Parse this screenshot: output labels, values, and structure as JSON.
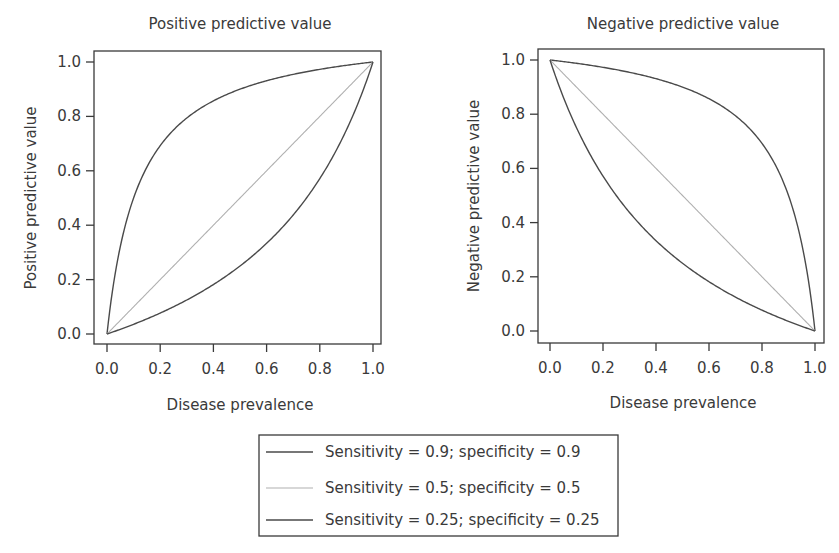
{
  "chart_data": [
    {
      "type": "line",
      "title": "Positive predictive value",
      "xlabel": "Disease prevalence",
      "ylabel": "Positive predictive value",
      "xlim": [
        0,
        1
      ],
      "ylim": [
        0,
        1
      ],
      "xticks": [
        "0.0",
        "0.2",
        "0.4",
        "0.6",
        "0.8",
        "1.0"
      ],
      "yticks": [
        "0.0",
        "0.2",
        "0.4",
        "0.6",
        "0.8",
        "1.0"
      ],
      "grid": false,
      "x": [
        0.0,
        0.05,
        0.1,
        0.2,
        0.3,
        0.4,
        0.5,
        0.6,
        0.7,
        0.8,
        0.9,
        0.95,
        1.0
      ],
      "series": [
        {
          "name": "Sensitivity = 0.9; specificity = 0.9",
          "values": [
            0.0,
            0.321,
            0.5,
            0.692,
            0.794,
            0.857,
            0.9,
            0.931,
            0.955,
            0.973,
            0.988,
            0.994,
            1.0
          ]
        },
        {
          "name": "Sensitivity = 0.5; specificity = 0.5",
          "values": [
            0.0,
            0.05,
            0.1,
            0.2,
            0.3,
            0.4,
            0.5,
            0.6,
            0.7,
            0.8,
            0.9,
            0.95,
            1.0
          ]
        },
        {
          "name": "Sensitivity = 0.25; specificity = 0.25",
          "values": [
            0.0,
            0.017,
            0.036,
            0.077,
            0.125,
            0.182,
            0.25,
            0.333,
            0.438,
            0.571,
            0.75,
            0.864,
            1.0
          ]
        }
      ]
    },
    {
      "type": "line",
      "title": "Negative predictive value",
      "xlabel": "Disease prevalence",
      "ylabel": "Negative predictive value",
      "xlim": [
        0,
        1
      ],
      "ylim": [
        0,
        1
      ],
      "xticks": [
        "0.0",
        "0.2",
        "0.4",
        "0.6",
        "0.8",
        "1.0"
      ],
      "yticks": [
        "0.0",
        "0.2",
        "0.4",
        "0.6",
        "0.8",
        "1.0"
      ],
      "grid": false,
      "x": [
        0.0,
        0.05,
        0.1,
        0.2,
        0.3,
        0.4,
        0.5,
        0.6,
        0.7,
        0.8,
        0.9,
        0.95,
        1.0
      ],
      "series": [
        {
          "name": "Sensitivity = 0.9; specificity = 0.9",
          "values": [
            1.0,
            0.994,
            0.988,
            0.973,
            0.955,
            0.931,
            0.9,
            0.857,
            0.794,
            0.692,
            0.5,
            0.321,
            0.0
          ]
        },
        {
          "name": "Sensitivity = 0.5; specificity = 0.5",
          "values": [
            1.0,
            0.95,
            0.9,
            0.8,
            0.7,
            0.6,
            0.5,
            0.4,
            0.3,
            0.2,
            0.1,
            0.05,
            0.0
          ]
        },
        {
          "name": "Sensitivity = 0.25; specificity = 0.25",
          "values": [
            1.0,
            0.864,
            0.75,
            0.571,
            0.438,
            0.333,
            0.25,
            0.182,
            0.125,
            0.077,
            0.036,
            0.017,
            0.0
          ]
        }
      ]
    }
  ],
  "legend": {
    "position": "bottom-center",
    "entries": [
      {
        "label": "Sensitivity = 0.9; specificity = 0.9",
        "color": "#4a4a4a",
        "se": 0.9,
        "sp": 0.9
      },
      {
        "label": "Sensitivity = 0.5; specificity = 0.5",
        "color": "#b0b0b0",
        "se": 0.5,
        "sp": 0.5
      },
      {
        "label": "Sensitivity = 0.25; specificity = 0.25",
        "color": "#4a4a4a",
        "se": 0.25,
        "sp": 0.25
      }
    ]
  },
  "colors": {
    "axis": "#3a3a3a",
    "line_dark": "#4a4a4a",
    "line_light": "#b0b0b0"
  }
}
